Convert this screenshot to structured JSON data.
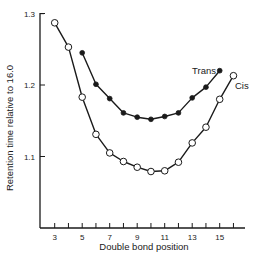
{
  "chart_data": {
    "type": "line",
    "title": "",
    "xlabel": "Double bond position",
    "ylabel": "Retention time relative to 16.0",
    "xlim": [
      2,
      17.2
    ],
    "ylim": [
      1.0,
      1.3
    ],
    "xticks_labeled": [
      3,
      5,
      7,
      9,
      11,
      13,
      15
    ],
    "xticks_minor": [
      4,
      6,
      8,
      10,
      12,
      14,
      16
    ],
    "yticks": [
      1.1,
      1.2,
      1.3
    ],
    "grid": false,
    "legend": "inline labels at line ends",
    "series": [
      {
        "name": "Trans",
        "marker": "filled-circle",
        "x": [
          5,
          6,
          7,
          8,
          9,
          10,
          11,
          12,
          13,
          14,
          15
        ],
        "values": [
          1.245,
          1.201,
          1.181,
          1.161,
          1.155,
          1.152,
          1.156,
          1.161,
          1.182,
          1.197,
          1.22
        ]
      },
      {
        "name": "Cis",
        "marker": "open-circle",
        "x": [
          3,
          4,
          5,
          6,
          7,
          8,
          9,
          10,
          11,
          12,
          13,
          14,
          15,
          16
        ],
        "values": [
          1.287,
          1.253,
          1.183,
          1.131,
          1.105,
          1.093,
          1.085,
          1.079,
          1.08,
          1.092,
          1.119,
          1.141,
          1.18,
          1.213
        ]
      }
    ]
  },
  "labels": {
    "xlabel": "Double bond position",
    "ylabel": "Retention time relative to 16.0",
    "trans": "Trans",
    "cis": "Cis"
  },
  "colors": {
    "line": "#1a1a1a",
    "background": "#ffffff"
  }
}
